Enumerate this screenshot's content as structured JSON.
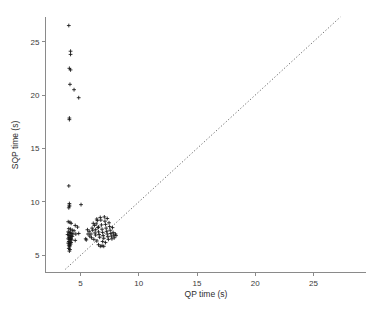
{
  "chart_data": {
    "type": "scatter",
    "title": "",
    "subtitle": "",
    "xlabel": "QP time (s)",
    "ylabel": "SQP time (s)",
    "xlim": [
      2.0,
      29.5
    ],
    "ylim": [
      3.4,
      27.3
    ],
    "xticks": [
      5,
      10,
      15,
      20,
      25
    ],
    "yticks": [
      5,
      10,
      15,
      20,
      25
    ],
    "xtick_labels": [
      "5",
      "10",
      "15",
      "20",
      "25"
    ],
    "ytick_labels": [
      "5",
      "10",
      "15",
      "20",
      "25"
    ],
    "grid": false,
    "legend": null,
    "legend_position": "none",
    "marker_symbol": "plus",
    "marker_color": "#141414",
    "annotations": [
      {
        "type": "reference-line",
        "label": "y = x identity line",
        "style": "dotted",
        "color": "#555555",
        "x_start": 3.7,
        "y_start": 3.7,
        "x_end": 27.3,
        "y_end": 27.3
      }
    ],
    "series": [
      {
        "name": "instances",
        "points": [
          [
            4.0,
            26.5
          ],
          [
            4.15,
            24.1
          ],
          [
            4.15,
            23.8
          ],
          [
            4.05,
            22.5
          ],
          [
            4.15,
            22.35
          ],
          [
            4.1,
            21.0
          ],
          [
            4.45,
            20.5
          ],
          [
            4.85,
            19.75
          ],
          [
            4.05,
            17.85
          ],
          [
            4.05,
            17.7
          ],
          [
            4.0,
            11.5
          ],
          [
            4.05,
            9.85
          ],
          [
            4.05,
            9.7
          ],
          [
            4.05,
            9.6
          ],
          [
            4.0,
            9.45
          ],
          [
            5.05,
            9.75
          ],
          [
            3.95,
            8.15
          ],
          [
            4.1,
            8.1
          ],
          [
            4.2,
            8.0
          ],
          [
            4.55,
            7.8
          ],
          [
            4.75,
            7.65
          ],
          [
            4.0,
            7.5
          ],
          [
            4.15,
            7.45
          ],
          [
            4.3,
            7.35
          ],
          [
            4.45,
            7.3
          ],
          [
            3.95,
            7.2
          ],
          [
            4.05,
            7.15
          ],
          [
            4.15,
            7.1
          ],
          [
            4.25,
            7.05
          ],
          [
            4.35,
            7.0
          ],
          [
            4.6,
            7.0
          ],
          [
            4.85,
            7.05
          ],
          [
            3.9,
            6.95
          ],
          [
            4.0,
            6.9
          ],
          [
            4.1,
            6.85
          ],
          [
            4.2,
            6.8
          ],
          [
            4.3,
            6.78
          ],
          [
            4.0,
            6.7
          ],
          [
            4.1,
            6.65
          ],
          [
            4.2,
            6.6
          ],
          [
            3.95,
            6.55
          ],
          [
            4.05,
            6.5
          ],
          [
            4.15,
            6.48
          ],
          [
            4.25,
            6.45
          ],
          [
            4.55,
            6.4
          ],
          [
            4.0,
            6.3
          ],
          [
            4.1,
            6.25
          ],
          [
            4.2,
            6.2
          ],
          [
            3.95,
            6.15
          ],
          [
            4.05,
            6.1
          ],
          [
            4.15,
            6.05
          ],
          [
            4.0,
            5.95
          ],
          [
            4.1,
            5.9
          ],
          [
            4.05,
            5.8
          ],
          [
            4.0,
            5.65
          ],
          [
            4.1,
            5.55
          ],
          [
            4.05,
            5.4
          ],
          [
            5.45,
            6.55
          ],
          [
            5.5,
            6.45
          ],
          [
            5.6,
            7.4
          ],
          [
            5.75,
            7.25
          ],
          [
            5.9,
            7.0
          ],
          [
            6.0,
            7.55
          ],
          [
            6.1,
            8.0
          ],
          [
            6.2,
            7.8
          ],
          [
            6.25,
            7.1
          ],
          [
            6.3,
            6.9
          ],
          [
            6.35,
            7.95
          ],
          [
            6.4,
            8.4
          ],
          [
            6.45,
            8.25
          ],
          [
            6.5,
            7.6
          ],
          [
            6.55,
            7.2
          ],
          [
            6.6,
            6.95
          ],
          [
            6.65,
            6.7
          ],
          [
            6.7,
            8.55
          ],
          [
            6.75,
            8.3
          ],
          [
            6.8,
            7.85
          ],
          [
            6.85,
            7.45
          ],
          [
            6.9,
            7.15
          ],
          [
            6.95,
            6.85
          ],
          [
            7.0,
            6.6
          ],
          [
            7.05,
            8.6
          ],
          [
            7.1,
            8.2
          ],
          [
            7.15,
            7.9
          ],
          [
            7.2,
            7.55
          ],
          [
            7.25,
            7.25
          ],
          [
            7.3,
            7.0
          ],
          [
            7.35,
            6.75
          ],
          [
            7.4,
            6.5
          ],
          [
            7.45,
            8.05
          ],
          [
            7.5,
            7.7
          ],
          [
            7.55,
            7.35
          ],
          [
            7.6,
            7.05
          ],
          [
            7.65,
            6.8
          ],
          [
            7.7,
            6.55
          ],
          [
            7.75,
            7.6
          ],
          [
            7.8,
            7.15
          ],
          [
            7.85,
            6.9
          ],
          [
            7.9,
            6.65
          ],
          [
            8.0,
            7.0
          ],
          [
            8.05,
            6.85
          ],
          [
            6.55,
            6.0
          ],
          [
            6.7,
            5.85
          ],
          [
            6.85,
            5.9
          ],
          [
            7.0,
            5.85
          ],
          [
            6.9,
            6.3
          ],
          [
            7.15,
            6.2
          ],
          [
            6.4,
            6.35
          ],
          [
            6.15,
            6.5
          ],
          [
            5.95,
            6.65
          ],
          [
            5.8,
            6.8
          ],
          [
            5.65,
            7.0
          ],
          [
            6.05,
            7.35
          ],
          [
            6.3,
            7.4
          ],
          [
            6.55,
            7.65
          ],
          [
            7.3,
            8.45
          ]
        ]
      }
    ]
  },
  "figure": {
    "background_color": "#ffffff",
    "axis_color": "#8a8a8a"
  }
}
